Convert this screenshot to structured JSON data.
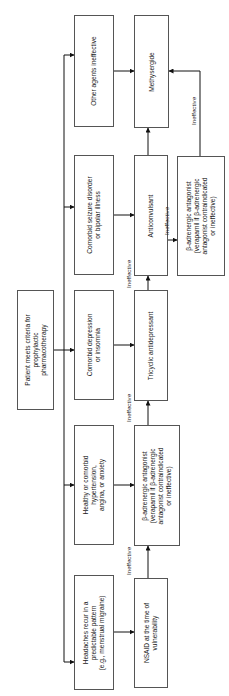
{
  "diagram": {
    "start": "Patient meets criteria for\nprophylactic\npharmacotherapy",
    "conditions": [
      "Other agents ineffective",
      "Comorbid seizure disorder\nor bipolar illness",
      "Comorbid depression\nor insomnia",
      "Healthy or comorbid\nhypertension,\nangina, or anxiety",
      "Headaches recur in a\npredictable pattern\n(e.g., menstrual migraine)"
    ],
    "treatments": [
      "Methysergide",
      "Anticonvulsant",
      "Tricyclic antidepressant",
      "β-adrenergic antagonist\n(verapamil if β-adrenergic\nantagonist contraindicated\nor ineffective)",
      "NSAID at the time of\nvulnerability"
    ],
    "secondary": "β-adrenergic antagonist\n(verapamil if β-adrenergic\nantagonist contraindicated\nor ineffective)",
    "edge_label": "Ineffective",
    "edges": [
      {
        "from": "start",
        "to": "all conditions"
      },
      {
        "from": "Other agents ineffective",
        "to": "Methysergide"
      },
      {
        "from": "Comorbid seizure disorder or bipolar illness",
        "to": "Anticonvulsant"
      },
      {
        "from": "Comorbid depression or insomnia",
        "to": "Tricyclic antidepressant"
      },
      {
        "from": "Healthy or comorbid hypertension, angina, or anxiety",
        "to": "β-adrenergic antagonist"
      },
      {
        "from": "Headaches recur in a predictable pattern",
        "to": "NSAID at the time of vulnerability"
      },
      {
        "from": "NSAID at the time of vulnerability",
        "to": "β-adrenergic antagonist",
        "label": "Ineffective"
      },
      {
        "from": "β-adrenergic antagonist",
        "to": "Tricyclic antidepressant",
        "label": "Ineffective"
      },
      {
        "from": "Tricyclic antidepressant",
        "to": "Anticonvulsant",
        "label": "Ineffective"
      },
      {
        "from": "Anticonvulsant",
        "to": "Methysergide"
      },
      {
        "from": "Anticonvulsant",
        "to": "β-adrenergic antagonist (secondary)",
        "label": "Ineffective"
      },
      {
        "from": "β-adrenergic antagonist (secondary)",
        "to": "Methysergide",
        "label": "Ineffective"
      }
    ]
  }
}
